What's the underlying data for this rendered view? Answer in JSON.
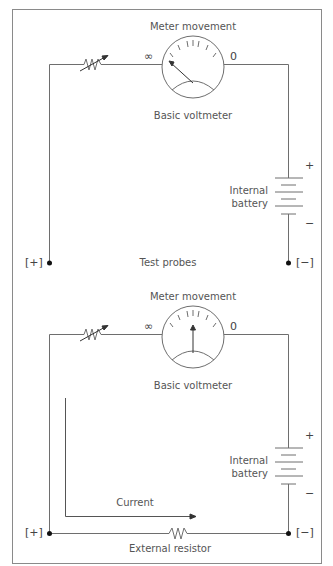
{
  "figure": {
    "frame_color": "#8a8a8a",
    "wire_color": "#6e6e6e",
    "terminal_color": "#111111"
  },
  "top_panel": {
    "meter_title": "Meter movement",
    "meter_caption": "Basic voltmeter",
    "scale_left": "∞",
    "scale_right": "0",
    "needle_position": "infinity",
    "battery_label_line1": "Internal",
    "battery_label_line2": "battery",
    "battery_plus": "+",
    "battery_minus": "−",
    "probe_positive": "[+]",
    "probe_negative": "[−]",
    "probes_label": "Test probes"
  },
  "bottom_panel": {
    "meter_title": "Meter movement",
    "meter_caption": "Basic voltmeter",
    "scale_left": "∞",
    "scale_right": "0",
    "needle_position": "mid-scale",
    "battery_label_line1": "Internal",
    "battery_label_line2": "battery",
    "battery_plus": "+",
    "battery_minus": "−",
    "probe_positive": "[+]",
    "probe_negative": "[−]",
    "current_label": "Current",
    "resistor_label": "External resistor"
  }
}
